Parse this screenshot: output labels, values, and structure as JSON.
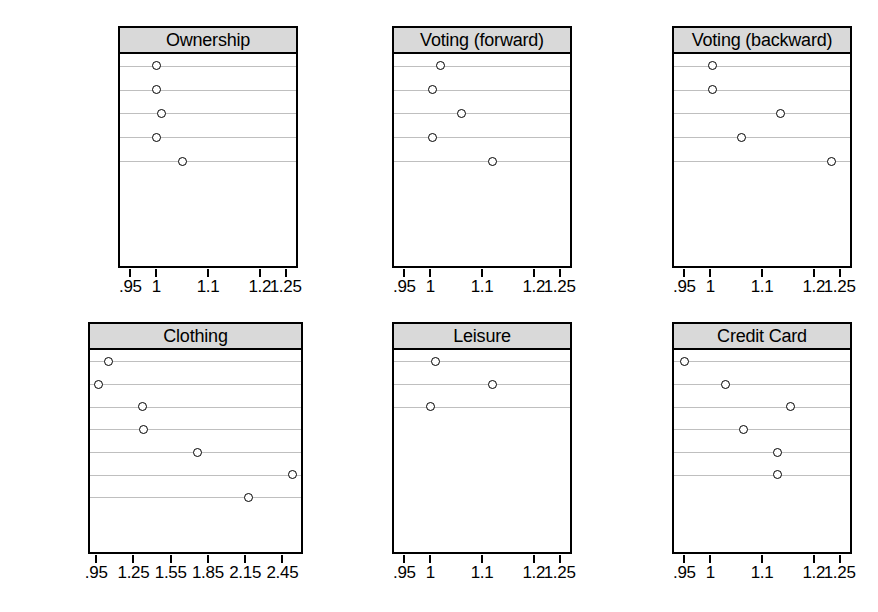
{
  "figure": {
    "width": 878,
    "height": 612,
    "background": "#ffffff",
    "strip_background": "#d9d9d9",
    "gridline_color": "#bfbfbf",
    "point_color": "#000000"
  },
  "chart_data": [
    {
      "type": "scatter",
      "title": "Ownership",
      "xlabel": "",
      "ylabel": "",
      "xlim": [
        0.93,
        1.27
      ],
      "grid": true,
      "legend": null,
      "tick_values": [
        0.95,
        1,
        1.1,
        1.2,
        1.25
      ],
      "tick_labels": [
        ".95",
        "1",
        "1.1",
        "1.2",
        "1.25"
      ],
      "categories": [
        "Home",
        "Car",
        "Computer",
        "TV",
        "DVD"
      ],
      "values": [
        1.0,
        1.0,
        1.01,
        1.0,
        1.05
      ]
    },
    {
      "type": "scatter",
      "title": "Voting (forward)",
      "xlabel": "",
      "ylabel": "",
      "xlim": [
        0.93,
        1.27
      ],
      "grid": true,
      "legend": null,
      "tick_values": [
        0.95,
        1,
        1.1,
        1.2,
        1.25
      ],
      "tick_labels": [
        ".95",
        "1",
        "1.1",
        "1.2",
        "1.25"
      ],
      "categories": [
        "Prim00",
        "Pres01",
        "Prim04",
        "Pres04",
        "Prim08"
      ],
      "values": [
        1.02,
        1.005,
        1.06,
        1.005,
        1.12
      ]
    },
    {
      "type": "scatter",
      "title": "Voting (backward)",
      "xlabel": "",
      "ylabel": "",
      "xlim": [
        0.93,
        1.27
      ],
      "grid": true,
      "legend": null,
      "tick_values": [
        0.95,
        1,
        1.1,
        1.2,
        1.25
      ],
      "tick_labels": [
        ".95",
        "1",
        "1.1",
        "1.2",
        "1.25"
      ],
      "categories": [
        "Prim08",
        "Pres04",
        "Prim04",
        "Pres00",
        "Prim00"
      ],
      "values": [
        1.005,
        1.005,
        1.135,
        1.06,
        1.235
      ]
    },
    {
      "type": "scatter",
      "title": "Clothing",
      "xlabel": "",
      "ylabel": "",
      "xlim": [
        0.9,
        2.6
      ],
      "grid": true,
      "legend": null,
      "tick_values": [
        0.95,
        1.25,
        1.55,
        1.85,
        2.15,
        2.45
      ],
      "tick_labels": [
        ".95",
        "1.25",
        "1.55",
        "1.85",
        "2.15",
        "2.45"
      ],
      "categories": [
        "Coat",
        "Shirt",
        "Pants",
        "Shoes",
        "Suit",
        "Dress",
        "Skirt"
      ],
      "values": [
        1.05,
        0.97,
        1.32,
        1.33,
        1.77,
        2.53,
        2.18
      ]
    },
    {
      "type": "scatter",
      "title": "Leisure",
      "xlabel": "",
      "ylabel": "",
      "xlim": [
        0.93,
        1.27
      ],
      "grid": true,
      "legend": null,
      "tick_values": [
        0.95,
        1,
        1.1,
        1.2,
        1.25
      ],
      "tick_labels": [
        ".95",
        "1",
        "1.1",
        "1.2",
        "1.25"
      ],
      "categories": [
        "Movie",
        "Museum",
        "Restr."
      ],
      "values": [
        1.01,
        1.12,
        1.0
      ]
    },
    {
      "type": "scatter",
      "title": "Credit Card",
      "xlabel": "",
      "ylabel": "",
      "xlim": [
        0.93,
        1.27
      ],
      "grid": true,
      "legend": null,
      "tick_values": [
        0.95,
        1,
        1.1,
        1.2,
        1.25
      ],
      "tick_labels": [
        ".95",
        "1",
        "1.1",
        "1.2",
        "1.25"
      ],
      "categories": [
        "Master",
        "Visa",
        "Discover",
        "Amex",
        "Gas",
        "Store"
      ],
      "values": [
        0.95,
        1.03,
        1.155,
        1.065,
        1.13,
        1.13
      ]
    }
  ],
  "layout": {
    "panels": [
      {
        "left": 118,
        "top": 26,
        "width": 180,
        "height": 242,
        "rows": 5,
        "row_capacity": 9
      },
      {
        "left": 392,
        "top": 26,
        "width": 180,
        "height": 242,
        "rows": 5,
        "row_capacity": 9
      },
      {
        "left": 672,
        "top": 26,
        "width": 180,
        "height": 242,
        "rows": 5,
        "row_capacity": 9
      },
      {
        "left": 88,
        "top": 322,
        "width": 215,
        "height": 232,
        "rows": 7,
        "row_capacity": 9
      },
      {
        "left": 392,
        "top": 322,
        "width": 180,
        "height": 232,
        "rows": 3,
        "row_capacity": 9
      },
      {
        "left": 672,
        "top": 322,
        "width": 180,
        "height": 232,
        "rows": 6,
        "row_capacity": 9
      }
    ]
  }
}
